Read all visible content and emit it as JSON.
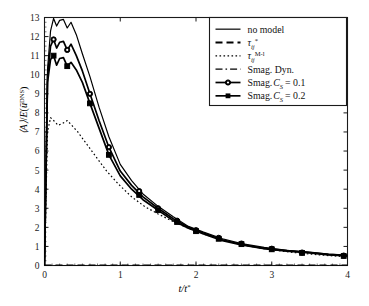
{
  "chart_data": {
    "type": "line",
    "title": "",
    "xlabel": "t/t*",
    "ylabel": "⟨A⟩/E(ū^DNS)",
    "xlim": [
      0,
      4
    ],
    "ylim": [
      0,
      13
    ],
    "xticks": [
      "0",
      "1",
      "2",
      "3",
      "4"
    ],
    "yticks": [
      "0",
      "1",
      "2",
      "3",
      "4",
      "5",
      "6",
      "7",
      "8",
      "9",
      "10",
      "11",
      "12",
      "13"
    ],
    "grid": false,
    "legend_position": "top-right",
    "series": [
      {
        "name": "no model",
        "style": "solid",
        "marker": "none",
        "x": [
          0,
          0.04,
          0.08,
          0.12,
          0.16,
          0.2,
          0.25,
          0.3,
          0.35,
          0.42,
          0.5,
          0.6,
          0.72,
          0.85,
          1.0,
          1.15,
          1.3,
          1.5,
          1.7,
          1.9,
          2.1,
          2.35,
          2.6,
          2.9,
          3.2,
          3.5,
          3.75,
          4.0
        ],
        "y": [
          0.0,
          10.3,
          12.3,
          12.95,
          12.55,
          12.85,
          12.9,
          12.45,
          12.75,
          12.1,
          11.1,
          9.9,
          8.3,
          6.75,
          5.3,
          4.45,
          3.75,
          3.1,
          2.55,
          2.05,
          1.75,
          1.4,
          1.15,
          0.95,
          0.8,
          0.7,
          0.6,
          0.55
        ]
      },
      {
        "name": "Smag. C_S = 0.1",
        "style": "solid",
        "marker": "circle",
        "x": [
          0,
          0.04,
          0.08,
          0.12,
          0.16,
          0.2,
          0.25,
          0.3,
          0.35,
          0.42,
          0.5,
          0.6,
          0.72,
          0.85,
          1.0,
          1.15,
          1.3,
          1.5,
          1.7,
          1.9,
          2.1,
          2.35,
          2.6,
          2.9,
          3.2,
          3.5,
          3.75,
          4.0
        ],
        "y": [
          0.0,
          9.9,
          11.5,
          11.85,
          11.4,
          11.7,
          11.75,
          11.3,
          11.6,
          11.0,
          10.2,
          9.0,
          7.6,
          6.2,
          4.95,
          4.2,
          3.6,
          3.0,
          2.45,
          2.0,
          1.7,
          1.35,
          1.1,
          0.9,
          0.78,
          0.68,
          0.58,
          0.52
        ],
        "marker_x": [
          0.12,
          0.3,
          0.6,
          0.85,
          1.25,
          1.5,
          1.75,
          2.0,
          2.3,
          2.6,
          3.0,
          3.4,
          3.95
        ],
        "marker_y": [
          11.85,
          11.3,
          9.0,
          6.2,
          3.9,
          3.0,
          2.35,
          1.85,
          1.45,
          1.15,
          0.88,
          0.68,
          0.52
        ]
      },
      {
        "name": "Smag. C_S = 0.2",
        "style": "solid",
        "marker": "square",
        "x": [
          0,
          0.04,
          0.08,
          0.12,
          0.16,
          0.2,
          0.25,
          0.3,
          0.35,
          0.42,
          0.5,
          0.6,
          0.72,
          0.85,
          1.0,
          1.15,
          1.3,
          1.5,
          1.7,
          1.9,
          2.1,
          2.35,
          2.6,
          2.9,
          3.2,
          3.5,
          3.75,
          4.0
        ],
        "y": [
          0.0,
          9.6,
          10.8,
          11.0,
          10.5,
          10.85,
          10.9,
          10.45,
          10.65,
          10.25,
          9.6,
          8.5,
          7.2,
          5.8,
          4.7,
          4.0,
          3.45,
          2.9,
          2.35,
          1.95,
          1.65,
          1.3,
          1.08,
          0.88,
          0.75,
          0.66,
          0.56,
          0.5
        ],
        "marker_x": [
          0.12,
          0.3,
          0.6,
          0.85,
          1.25,
          1.5,
          1.75,
          2.0,
          2.3,
          2.6,
          3.0,
          3.4,
          3.95
        ],
        "marker_y": [
          11.0,
          10.45,
          8.5,
          5.8,
          3.7,
          2.9,
          2.28,
          1.8,
          1.4,
          1.12,
          0.85,
          0.66,
          0.5
        ]
      },
      {
        "name": "tau_ij^{M-l}",
        "style": "dotted",
        "marker": "none",
        "x": [
          0,
          0.04,
          0.08,
          0.12,
          0.18,
          0.24,
          0.3,
          0.36,
          0.44,
          0.55,
          0.68,
          0.82,
          0.98,
          1.15,
          1.32,
          1.5,
          1.7,
          1.9,
          2.1,
          2.35,
          2.6,
          2.9,
          3.2,
          3.5,
          3.75,
          4.0
        ],
        "y": [
          0.0,
          7.0,
          7.75,
          7.6,
          7.35,
          7.45,
          7.6,
          7.35,
          7.0,
          6.4,
          5.7,
          4.95,
          4.25,
          3.6,
          3.1,
          2.7,
          2.3,
          1.95,
          1.65,
          1.35,
          1.1,
          0.88,
          0.72,
          0.6,
          0.52,
          0.46
        ]
      },
      {
        "name": "tau_ij^{*}",
        "style": "dashed",
        "marker": "none",
        "x": [
          0,
          4
        ],
        "y": [
          0.0,
          0.0
        ]
      },
      {
        "name": "Smag. Dyn.",
        "style": "dashdot",
        "marker": "none",
        "x": [
          0,
          4
        ],
        "y": [
          0.0,
          0.0
        ]
      }
    ]
  },
  "axes": {
    "xlabel_num": "t/t",
    "xlabel_star": "*",
    "ylabel_parts": {
      "a": "⟨A⟩",
      "slash": "/",
      "e": "E",
      "open": "(",
      "ubar": "ū",
      "sup": "DNS",
      "close": ")"
    }
  },
  "legend": {
    "entries": [
      {
        "label": "no model",
        "kind": "plain",
        "style": "solid",
        "marker": "none"
      },
      {
        "label": "τ",
        "kind": "tau",
        "sub": "ij",
        "sup": "*",
        "style": "dashed",
        "marker": "none"
      },
      {
        "label": "τ",
        "kind": "tau",
        "sub": "ij",
        "sup": "M-l",
        "style": "dotted",
        "marker": "none"
      },
      {
        "label": "Smag. Dyn.",
        "kind": "plain",
        "style": "dashdot",
        "marker": "none"
      },
      {
        "label": "Smag.",
        "kind": "smag",
        "cs": "C",
        "cs_sub": "S",
        "eq": "= 0.1",
        "style": "solid",
        "marker": "circle"
      },
      {
        "label": "Smag.",
        "kind": "smag",
        "cs": "C",
        "cs_sub": "S",
        "eq": "= 0.2",
        "style": "solid",
        "marker": "square"
      }
    ]
  },
  "colors": {
    "line": "#000000",
    "frame": "#1a1a1a",
    "background": "#ffffff"
  }
}
